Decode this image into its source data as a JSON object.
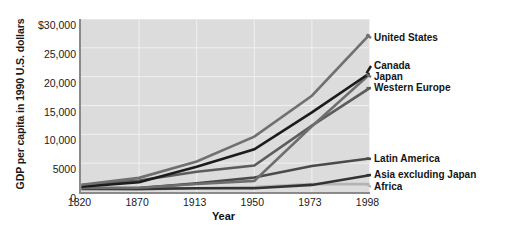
{
  "chart_data": {
    "type": "line",
    "title": "",
    "xlabel": "Year",
    "ylabel": "GDP per capita in 1990 U.S. dollars",
    "x": [
      1820,
      1870,
      1913,
      1950,
      1973,
      1998
    ],
    "xticklabels": [
      "1820",
      "1870",
      "1913",
      "1950",
      "1973",
      "1998"
    ],
    "yticklabels": [
      "$30,000",
      "25,000",
      "20,000",
      "15,000",
      "10,000",
      "5000",
      "0"
    ],
    "ytickvalues": [
      30000,
      25000,
      20000,
      15000,
      10000,
      5000,
      0
    ],
    "ylim": [
      0,
      30000
    ],
    "xlim": [
      1820,
      1998
    ],
    "grid": true,
    "legend_position": "right-callout",
    "plot_background": "#dcdcdc",
    "series": [
      {
        "name": "United States",
        "color": "#707070",
        "values": [
          1250,
          2450,
          5300,
          9600,
          16700,
          27300
        ]
      },
      {
        "name": "Canada",
        "color": "#1c1c1c",
        "values": [
          900,
          1700,
          4400,
          7400,
          13800,
          20600
        ]
      },
      {
        "name": "Japan",
        "color": "#6e6e6e",
        "values": [
          700,
          740,
          1390,
          1930,
          11400,
          20400
        ]
      },
      {
        "name": "Western Europe",
        "color": "#5c5c5c",
        "values": [
          1200,
          2000,
          3500,
          4600,
          11500,
          18000
        ]
      },
      {
        "name": "Latin America",
        "color": "#4a4a4a",
        "values": [
          700,
          700,
          1500,
          2500,
          4500,
          5800
        ]
      },
      {
        "name": "Asia excluding Japan",
        "color": "#333333",
        "values": [
          580,
          550,
          660,
          640,
          1230,
          2900
        ]
      },
      {
        "name": "Africa",
        "color": "#b4b4b4",
        "values": [
          420,
          440,
          640,
          850,
          1400,
          1370
        ]
      }
    ]
  },
  "axis": {
    "y_title": "GDP per capita in 1990 U.S. dollars",
    "x_title": "Year"
  },
  "callouts": [
    {
      "label": "United States",
      "index": 0
    },
    {
      "label": "Canada",
      "index": 1
    },
    {
      "label": "Japan",
      "index": 2
    },
    {
      "label": "Western Europe",
      "index": 3
    },
    {
      "label": "Latin America",
      "index": 4
    },
    {
      "label": "Asia excluding Japan",
      "index": 5
    },
    {
      "label": "Africa",
      "index": 6
    }
  ]
}
